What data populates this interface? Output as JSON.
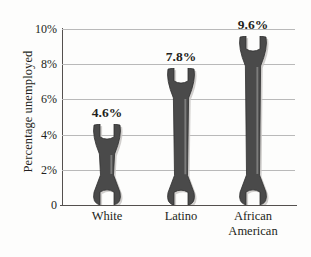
{
  "chart_data": {
    "type": "bar",
    "title": "",
    "subtitle": "",
    "xlabel": "",
    "ylabel": "Percentage unemployed",
    "categories": [
      "White",
      "Latino",
      "African American"
    ],
    "category_lines": [
      [
        "White"
      ],
      [
        "Latino"
      ],
      [
        "African",
        "American"
      ]
    ],
    "values": [
      4.6,
      7.8,
      9.6
    ],
    "value_labels": [
      "4.6%",
      "7.8%",
      "9.6%"
    ],
    "ylim": [
      0,
      10
    ],
    "y_ticks": [
      0,
      2,
      4,
      6,
      8,
      10
    ],
    "y_tick_labels": [
      "0",
      "2%",
      "4%",
      "6%",
      "8%",
      "10%"
    ],
    "grid": true,
    "grid_axis": "y",
    "legend": false,
    "legend_position": "none",
    "bar_style": "wrench-pictogram",
    "series": [
      {
        "name": "Percentage unemployed",
        "values": [
          4.6,
          7.8,
          9.6
        ]
      }
    ],
    "colors": {
      "bar_fill": "#4a4a4a",
      "bar_edge": "#2f2f2f",
      "bar_highlight": "#f2f2f0",
      "bar_shadow": "#c9c7c4",
      "gridline": "#b9b9b9",
      "axis": "#54504e",
      "text": "#231f20",
      "background": "#fdfdfc"
    }
  }
}
